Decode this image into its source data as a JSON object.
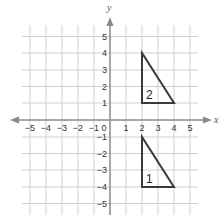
{
  "diagram": {
    "type": "coordinate-plane",
    "x_axis": {
      "label": "x",
      "min": -5,
      "max": 5,
      "ticks": [
        "−5",
        "−4",
        "−3",
        "−2",
        "−1",
        "0",
        "1",
        "2",
        "3",
        "4",
        "5"
      ]
    },
    "y_axis": {
      "label": "y",
      "min": -5,
      "max": 5,
      "ticks": [
        "5",
        "4",
        "3",
        "2",
        "1",
        "−1",
        "−2",
        "−3",
        "−4",
        "−5"
      ]
    },
    "origin_label": "0",
    "shapes": [
      {
        "name": "triangle-2",
        "label": "2",
        "vertices": [
          [
            2,
            4
          ],
          [
            2,
            1
          ],
          [
            4,
            1
          ]
        ]
      },
      {
        "name": "triangle-1",
        "label": "1",
        "vertices": [
          [
            2,
            -1
          ],
          [
            2,
            -4
          ],
          [
            4,
            -4
          ]
        ]
      }
    ],
    "colors": {
      "grid": "#c8c8c8",
      "axis": "#8a8a8a",
      "shape": "#3a3a3a"
    }
  }
}
